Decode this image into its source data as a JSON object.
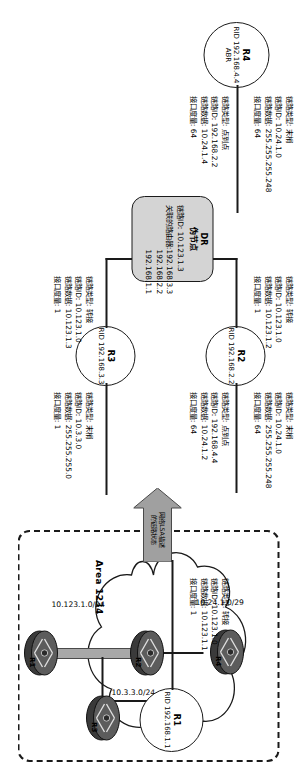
{
  "diagram": {
    "area_label": "Area 1234",
    "colors": {
      "stroke": "#1a1a1a",
      "pseudonode_fill": "#d4d4d4",
      "arrow_fill": "#a0a0a0",
      "lan_bar": "#a8a8a8"
    }
  },
  "routers": [
    {
      "id": "r1",
      "name": "R1",
      "rid": "RID 192.168.1.1",
      "role": ""
    },
    {
      "id": "r2",
      "name": "R2",
      "rid": "RID 192.168.2.2",
      "role": ""
    },
    {
      "id": "r3",
      "name": "R3",
      "rid": "RID 192.168.3.3",
      "role": ""
    },
    {
      "id": "r4",
      "name": "R4",
      "rid": "RID 192.168.4.4",
      "role": "ABR"
    }
  ],
  "labels": {
    "link_type": "链路类型:",
    "link_id": "链路ID:",
    "link_data": "链路数据:",
    "metric": "接口度量:",
    "assoc_routers": "关联的路由器:"
  },
  "link_blocks": [
    {
      "id": "r1-transit",
      "owner": "R1",
      "type": "转接",
      "link_id": "10.123.1.0",
      "link_data": "10.123.1.1",
      "metric": "1"
    },
    {
      "id": "r2-transit",
      "owner": "R2",
      "type": "转接",
      "link_id": "10.123.1.0",
      "link_data": "10.123.1.2",
      "metric": "1"
    },
    {
      "id": "r3-transit",
      "owner": "R3",
      "type": "转接",
      "link_id": "10.123.1.0",
      "link_data": "10.123.1.3",
      "metric": "1"
    },
    {
      "id": "r2-stub",
      "owner": "R2",
      "type": "末梢",
      "link_id": "10.24.1.0",
      "link_data": "255.255.255.248",
      "metric": "64"
    },
    {
      "id": "r2-p2p",
      "owner": "R2",
      "type": "点到点",
      "link_id": "192.168.4.4",
      "link_data": "10.24.1.2",
      "metric": "64"
    },
    {
      "id": "r3-stub",
      "owner": "R3",
      "type": "末梢",
      "link_id": "10.3.3.0",
      "link_data": "255.255.255.0",
      "metric": "1"
    },
    {
      "id": "r4-stub",
      "owner": "R4",
      "type": "末梢",
      "link_id": "10.24.1.0",
      "link_data": "255.255.255.248",
      "metric": "64"
    },
    {
      "id": "r4-p2p",
      "owner": "R4",
      "type": "点到点",
      "link_id": "192.168.2.2",
      "link_data": "10.24.1.4",
      "metric": "64"
    }
  ],
  "pseudonode": {
    "title_line1": "DR",
    "title_line2": "伪节点",
    "link_id_label": "链路ID:",
    "link_id": "10.123.1.3",
    "assoc_label": "关联的路由器:",
    "assoc_routers": [
      "192.168.3.3",
      "192.168.2.2",
      "192.168.1.1"
    ]
  },
  "arrow": {
    "line1": "网络LSA描述",
    "line2": "的链路状态"
  },
  "area": {
    "name": "Area 1234",
    "networks": [
      {
        "id": "net-r4-r2",
        "label": "10.24.1.0/29"
      },
      {
        "id": "net-r3-stub",
        "label": "10.3.3.0/24"
      },
      {
        "id": "net-lan",
        "label": "10.123.1.0/24"
      }
    ],
    "nodes": [
      {
        "id": "area-r4",
        "label": "R4"
      },
      {
        "id": "area-r2",
        "label": "R2"
      },
      {
        "id": "area-r3",
        "label": "R3"
      },
      {
        "id": "area-r1",
        "label": "R1"
      }
    ]
  }
}
